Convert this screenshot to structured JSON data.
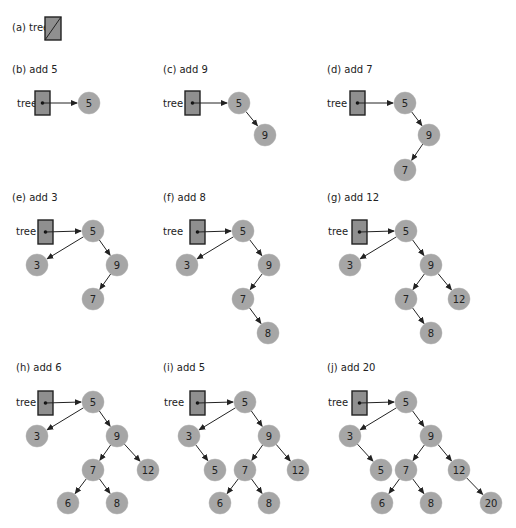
{
  "figure": {
    "root_variable": "tree",
    "node_color": "#a6a6a6",
    "pointer_box_color": "#8f8f8f",
    "panels": [
      {
        "id": "a",
        "label": "(a) tree",
        "label_pos": [
          12,
          31
        ],
        "null_box": {
          "x": 45,
          "y": 17,
          "w": 16,
          "h": 23
        },
        "nodes": [],
        "edges": []
      },
      {
        "id": "b",
        "label": "(b) add 5",
        "label_pos": [
          12,
          73
        ],
        "tree_label_pos": [
          17,
          107
        ],
        "box": {
          "x": 35,
          "y": 91,
          "w": 15,
          "h": 24
        },
        "nodes": [
          {
            "id": "n5",
            "value": "5",
            "x": 89,
            "y": 103
          }
        ],
        "edges": []
      },
      {
        "id": "c",
        "label": "(c) add 9",
        "label_pos": [
          163,
          73
        ],
        "tree_label_pos": [
          163,
          107
        ],
        "box": {
          "x": 185,
          "y": 91,
          "w": 15,
          "h": 24
        },
        "nodes": [
          {
            "id": "n5",
            "value": "5",
            "x": 239,
            "y": 103
          },
          {
            "id": "n9",
            "value": "9",
            "x": 265,
            "y": 135
          }
        ],
        "edges": [
          [
            "n5",
            "n9"
          ]
        ]
      },
      {
        "id": "d",
        "label": "(d) add 7",
        "label_pos": [
          327,
          73
        ],
        "tree_label_pos": [
          327,
          107
        ],
        "box": {
          "x": 350,
          "y": 91,
          "w": 15,
          "h": 24
        },
        "nodes": [
          {
            "id": "n5",
            "value": "5",
            "x": 405,
            "y": 103
          },
          {
            "id": "n9",
            "value": "9",
            "x": 429,
            "y": 135
          },
          {
            "id": "n7",
            "value": "7",
            "x": 405,
            "y": 170
          }
        ],
        "edges": [
          [
            "n5",
            "n9"
          ],
          [
            "n9",
            "n7"
          ]
        ]
      },
      {
        "id": "e",
        "label": "(e) add 3",
        "label_pos": [
          12,
          201
        ],
        "tree_label_pos": [
          16,
          235
        ],
        "box": {
          "x": 38,
          "y": 220,
          "w": 15,
          "h": 24
        },
        "nodes": [
          {
            "id": "n5",
            "value": "5",
            "x": 93,
            "y": 231
          },
          {
            "id": "n3",
            "value": "3",
            "x": 37,
            "y": 265
          },
          {
            "id": "n9",
            "value": "9",
            "x": 117,
            "y": 265
          },
          {
            "id": "n7",
            "value": "7",
            "x": 93,
            "y": 299
          }
        ],
        "edges": [
          [
            "n5",
            "n3"
          ],
          [
            "n5",
            "n9"
          ],
          [
            "n9",
            "n7"
          ]
        ]
      },
      {
        "id": "f",
        "label": "(f) add 8",
        "label_pos": [
          163,
          201
        ],
        "tree_label_pos": [
          163,
          235
        ],
        "box": {
          "x": 190,
          "y": 220,
          "w": 15,
          "h": 24
        },
        "nodes": [
          {
            "id": "n5",
            "value": "5",
            "x": 243,
            "y": 231
          },
          {
            "id": "n3",
            "value": "3",
            "x": 187,
            "y": 265
          },
          {
            "id": "n9",
            "value": "9",
            "x": 269,
            "y": 265
          },
          {
            "id": "n7",
            "value": "7",
            "x": 243,
            "y": 299
          },
          {
            "id": "n8",
            "value": "8",
            "x": 268,
            "y": 333
          }
        ],
        "edges": [
          [
            "n5",
            "n3"
          ],
          [
            "n5",
            "n9"
          ],
          [
            "n9",
            "n7"
          ],
          [
            "n7",
            "n8"
          ]
        ]
      },
      {
        "id": "g",
        "label": "(g) add 12",
        "label_pos": [
          327,
          201
        ],
        "tree_label_pos": [
          328,
          235
        ],
        "box": {
          "x": 352,
          "y": 220,
          "w": 15,
          "h": 24
        },
        "nodes": [
          {
            "id": "n5",
            "value": "5",
            "x": 406,
            "y": 231
          },
          {
            "id": "n3",
            "value": "3",
            "x": 350,
            "y": 265
          },
          {
            "id": "n9",
            "value": "9",
            "x": 431,
            "y": 265
          },
          {
            "id": "n7",
            "value": "7",
            "x": 406,
            "y": 299
          },
          {
            "id": "n12",
            "value": "12",
            "x": 459,
            "y": 299
          },
          {
            "id": "n8",
            "value": "8",
            "x": 431,
            "y": 333
          }
        ],
        "edges": [
          [
            "n5",
            "n3"
          ],
          [
            "n5",
            "n9"
          ],
          [
            "n9",
            "n7"
          ],
          [
            "n9",
            "n12"
          ],
          [
            "n7",
            "n8"
          ]
        ]
      },
      {
        "id": "h",
        "label": "(h) add 6",
        "label_pos": [
          16,
          371
        ],
        "tree_label_pos": [
          16,
          406
        ],
        "box": {
          "x": 38,
          "y": 391,
          "w": 15,
          "h": 24
        },
        "nodes": [
          {
            "id": "n5",
            "value": "5",
            "x": 93,
            "y": 402
          },
          {
            "id": "n3",
            "value": "3",
            "x": 37,
            "y": 436
          },
          {
            "id": "n9",
            "value": "9",
            "x": 117,
            "y": 436
          },
          {
            "id": "n7",
            "value": "7",
            "x": 93,
            "y": 470
          },
          {
            "id": "n12",
            "value": "12",
            "x": 148,
            "y": 470
          },
          {
            "id": "n6",
            "value": "6",
            "x": 68,
            "y": 503
          },
          {
            "id": "n8",
            "value": "8",
            "x": 117,
            "y": 503
          }
        ],
        "edges": [
          [
            "n5",
            "n3"
          ],
          [
            "n5",
            "n9"
          ],
          [
            "n9",
            "n7"
          ],
          [
            "n9",
            "n12"
          ],
          [
            "n7",
            "n6"
          ],
          [
            "n7",
            "n8"
          ]
        ]
      },
      {
        "id": "i",
        "label": "(i) add 5",
        "label_pos": [
          163,
          371
        ],
        "tree_label_pos": [
          164,
          406
        ],
        "box": {
          "x": 190,
          "y": 391,
          "w": 15,
          "h": 24
        },
        "nodes": [
          {
            "id": "n5",
            "value": "5",
            "x": 245,
            "y": 402
          },
          {
            "id": "n3",
            "value": "3",
            "x": 189,
            "y": 436
          },
          {
            "id": "n9",
            "value": "9",
            "x": 269,
            "y": 436
          },
          {
            "id": "n5b",
            "value": "5",
            "x": 215,
            "y": 470
          },
          {
            "id": "n7",
            "value": "7",
            "x": 245,
            "y": 470
          },
          {
            "id": "n12",
            "value": "12",
            "x": 298,
            "y": 470
          },
          {
            "id": "n6",
            "value": "6",
            "x": 220,
            "y": 503
          },
          {
            "id": "n8",
            "value": "8",
            "x": 269,
            "y": 503
          }
        ],
        "edges": [
          [
            "n5",
            "n3"
          ],
          [
            "n5",
            "n9"
          ],
          [
            "n3",
            "n5b"
          ],
          [
            "n9",
            "n7"
          ],
          [
            "n9",
            "n12"
          ],
          [
            "n7",
            "n6"
          ],
          [
            "n7",
            "n8"
          ]
        ]
      },
      {
        "id": "j",
        "label": "(j) add 20",
        "label_pos": [
          327,
          371
        ],
        "tree_label_pos": [
          328,
          406
        ],
        "box": {
          "x": 352,
          "y": 391,
          "w": 15,
          "h": 24
        },
        "nodes": [
          {
            "id": "n5",
            "value": "5",
            "x": 406,
            "y": 402
          },
          {
            "id": "n3",
            "value": "3",
            "x": 350,
            "y": 436
          },
          {
            "id": "n9",
            "value": "9",
            "x": 431,
            "y": 436
          },
          {
            "id": "n5b",
            "value": "5",
            "x": 381,
            "y": 470
          },
          {
            "id": "n7",
            "value": "7",
            "x": 406,
            "y": 470
          },
          {
            "id": "n12",
            "value": "12",
            "x": 459,
            "y": 470
          },
          {
            "id": "n6",
            "value": "6",
            "x": 382,
            "y": 503
          },
          {
            "id": "n8",
            "value": "8",
            "x": 431,
            "y": 503
          },
          {
            "id": "n20",
            "value": "20",
            "x": 491,
            "y": 503
          }
        ],
        "edges": [
          [
            "n5",
            "n3"
          ],
          [
            "n5",
            "n9"
          ],
          [
            "n3",
            "n5b"
          ],
          [
            "n9",
            "n7"
          ],
          [
            "n9",
            "n12"
          ],
          [
            "n7",
            "n6"
          ],
          [
            "n7",
            "n8"
          ],
          [
            "n12",
            "n20"
          ]
        ]
      }
    ]
  }
}
